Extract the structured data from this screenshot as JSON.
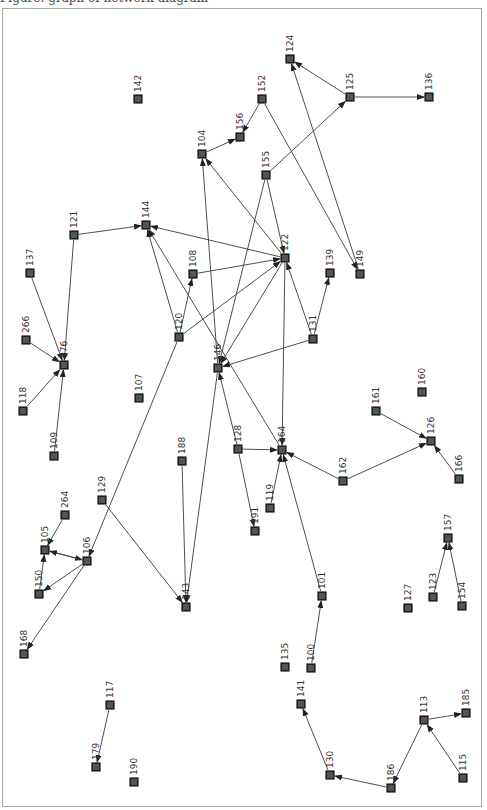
{
  "caption": "Figure: graph of network diagram",
  "colors": {
    "node_fill": "#555555",
    "node_stroke": "#1e1e1e",
    "edge": "#3a3a3a",
    "frame": "#a8a8a8",
    "label": "#333333"
  },
  "graph": {
    "nodes": [
      {
        "id": "124",
        "x": 290,
        "y": 59
      },
      {
        "id": "125",
        "x": 350,
        "y": 97
      },
      {
        "id": "136",
        "x": 429,
        "y": 97
      },
      {
        "id": "142",
        "x": 138,
        "y": 99
      },
      {
        "id": "152",
        "x": 262,
        "y": 99
      },
      {
        "id": "156",
        "x": 240,
        "y": 137
      },
      {
        "id": "104",
        "x": 202,
        "y": 154
      },
      {
        "id": "155",
        "x": 266,
        "y": 175
      },
      {
        "id": "144",
        "x": 146,
        "y": 225
      },
      {
        "id": "121",
        "x": 74,
        "y": 235
      },
      {
        "id": "122",
        "x": 285,
        "y": 258
      },
      {
        "id": "108",
        "x": 193,
        "y": 274
      },
      {
        "id": "137",
        "x": 30,
        "y": 273
      },
      {
        "id": "139",
        "x": 330,
        "y": 273
      },
      {
        "id": "149",
        "x": 360,
        "y": 274
      },
      {
        "id": "131",
        "x": 313,
        "y": 339
      },
      {
        "id": "266",
        "x": 26,
        "y": 340
      },
      {
        "id": "120",
        "x": 179,
        "y": 337
      },
      {
        "id": "146",
        "x": 218,
        "y": 368
      },
      {
        "id": "176",
        "x": 64,
        "y": 365
      },
      {
        "id": "107",
        "x": 139,
        "y": 398
      },
      {
        "id": "118",
        "x": 23,
        "y": 411
      },
      {
        "id": "160",
        "x": 422,
        "y": 392
      },
      {
        "id": "161",
        "x": 376,
        "y": 411
      },
      {
        "id": "126",
        "x": 431,
        "y": 441
      },
      {
        "id": "128",
        "x": 238,
        "y": 449
      },
      {
        "id": "164",
        "x": 282,
        "y": 450
      },
      {
        "id": "109",
        "x": 54,
        "y": 456
      },
      {
        "id": "188",
        "x": 182,
        "y": 461
      },
      {
        "id": "162",
        "x": 343,
        "y": 481
      },
      {
        "id": "166",
        "x": 459,
        "y": 479
      },
      {
        "id": "119",
        "x": 270,
        "y": 508
      },
      {
        "id": "129",
        "x": 102,
        "y": 500
      },
      {
        "id": "264",
        "x": 65,
        "y": 515
      },
      {
        "id": "191",
        "x": 255,
        "y": 531
      },
      {
        "id": "157",
        "x": 448,
        "y": 538
      },
      {
        "id": "105",
        "x": 45,
        "y": 550
      },
      {
        "id": "106",
        "x": 87,
        "y": 561
      },
      {
        "id": "150",
        "x": 39,
        "y": 594
      },
      {
        "id": "123",
        "x": 433,
        "y": 597
      },
      {
        "id": "101",
        "x": 322,
        "y": 596
      },
      {
        "id": "143",
        "x": 186,
        "y": 607
      },
      {
        "id": "154",
        "x": 462,
        "y": 606
      },
      {
        "id": "127",
        "x": 408,
        "y": 608
      },
      {
        "id": "168",
        "x": 24,
        "y": 654
      },
      {
        "id": "135",
        "x": 285,
        "y": 667
      },
      {
        "id": "100",
        "x": 311,
        "y": 668
      },
      {
        "id": "141",
        "x": 301,
        "y": 704
      },
      {
        "id": "117",
        "x": 110,
        "y": 705
      },
      {
        "id": "113",
        "x": 424,
        "y": 720
      },
      {
        "id": "185",
        "x": 466,
        "y": 713
      },
      {
        "id": "179",
        "x": 96,
        "y": 767
      },
      {
        "id": "190",
        "x": 134,
        "y": 782
      },
      {
        "id": "130",
        "x": 330,
        "y": 775
      },
      {
        "id": "115",
        "x": 463,
        "y": 778
      },
      {
        "id": "186",
        "x": 391,
        "y": 788
      }
    ],
    "edges": [
      {
        "from": "125",
        "to": "124"
      },
      {
        "from": "125",
        "to": "136"
      },
      {
        "from": "155",
        "to": "125"
      },
      {
        "from": "149",
        "to": "124"
      },
      {
        "from": "152",
        "to": "156"
      },
      {
        "from": "152",
        "to": "149"
      },
      {
        "from": "104",
        "to": "156"
      },
      {
        "from": "146",
        "to": "104"
      },
      {
        "from": "122",
        "to": "104"
      },
      {
        "from": "155",
        "to": "146"
      },
      {
        "from": "155",
        "to": "122"
      },
      {
        "from": "121",
        "to": "144"
      },
      {
        "from": "122",
        "to": "144"
      },
      {
        "from": "120",
        "to": "144"
      },
      {
        "from": "164",
        "to": "144"
      },
      {
        "from": "108",
        "to": "122"
      },
      {
        "from": "120",
        "to": "122"
      },
      {
        "from": "131",
        "to": "122"
      },
      {
        "from": "122",
        "to": "146"
      },
      {
        "from": "122",
        "to": "164"
      },
      {
        "from": "131",
        "to": "139"
      },
      {
        "from": "131",
        "to": "146"
      },
      {
        "from": "120",
        "to": "108"
      },
      {
        "from": "120",
        "to": "106"
      },
      {
        "from": "137",
        "to": "176"
      },
      {
        "from": "266",
        "to": "176"
      },
      {
        "from": "121",
        "to": "176"
      },
      {
        "from": "118",
        "to": "176"
      },
      {
        "from": "109",
        "to": "176"
      },
      {
        "from": "128",
        "to": "146"
      },
      {
        "from": "128",
        "to": "164"
      },
      {
        "from": "128",
        "to": "191"
      },
      {
        "from": "119",
        "to": "164"
      },
      {
        "from": "101",
        "to": "164"
      },
      {
        "from": "162",
        "to": "164"
      },
      {
        "from": "162",
        "to": "126"
      },
      {
        "from": "161",
        "to": "126"
      },
      {
        "from": "166",
        "to": "126"
      },
      {
        "from": "188",
        "to": "143"
      },
      {
        "from": "146",
        "to": "143"
      },
      {
        "from": "129",
        "to": "143"
      },
      {
        "from": "264",
        "to": "105"
      },
      {
        "from": "105",
        "to": "106"
      },
      {
        "from": "106",
        "to": "105"
      },
      {
        "from": "150",
        "to": "105"
      },
      {
        "from": "106",
        "to": "150"
      },
      {
        "from": "106",
        "to": "168"
      },
      {
        "from": "123",
        "to": "157"
      },
      {
        "from": "154",
        "to": "157"
      },
      {
        "from": "100",
        "to": "101"
      },
      {
        "from": "117",
        "to": "179"
      },
      {
        "from": "130",
        "to": "141"
      },
      {
        "from": "186",
        "to": "130"
      },
      {
        "from": "113",
        "to": "186"
      },
      {
        "from": "113",
        "to": "185"
      },
      {
        "from": "115",
        "to": "113"
      }
    ]
  }
}
